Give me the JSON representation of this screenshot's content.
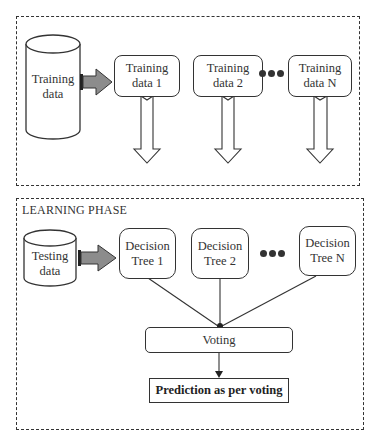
{
  "training_phase": {
    "source": {
      "label_line1": "Training",
      "label_line2": "data"
    },
    "subsets": [
      {
        "label_line1": "Training",
        "label_line2": "data 1"
      },
      {
        "label_line1": "Training",
        "label_line2": "data 2"
      },
      {
        "label_line1": "Training",
        "label_line2": "data N"
      }
    ]
  },
  "learning_phase": {
    "title": "LEARNING PHASE",
    "source": {
      "label_line1": "Testing",
      "label_line2": "data"
    },
    "trees": [
      {
        "label_line1": "Decision",
        "label_line2": "Tree 1"
      },
      {
        "label_line1": "Decision",
        "label_line2": "Tree 2"
      },
      {
        "label_line1": "Decision",
        "label_line2": "Tree N"
      }
    ],
    "voting": {
      "label": "Voting"
    },
    "prediction": {
      "label": "Prediction as per voting"
    }
  },
  "colors": {
    "stroke": "#333333",
    "arrow_fill": "#8c8c8c"
  }
}
